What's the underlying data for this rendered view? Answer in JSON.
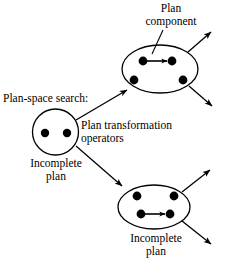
{
  "figure": {
    "background": "#ffffff",
    "stroke": "#000000",
    "width": 227,
    "height": 275
  },
  "labels": {
    "plan_component_line1": "Plan",
    "plan_component_line2": "component",
    "plan_space_search": "Plan-space search:",
    "plan_transformation_line1": "Plan transformation",
    "plan_transformation_line2": "operators",
    "incomplete_plan_left_line1": "Incomplete",
    "incomplete_plan_left_line2": "plan",
    "incomplete_plan_bottom_line1": "Incomplete",
    "incomplete_plan_bottom_line2": "plan"
  },
  "nodes": [
    {
      "id": "left-circle",
      "name": "incomplete-plan-node-left",
      "shape": "circle",
      "cx": 55.5,
      "cy": 132,
      "rx": 23,
      "ry": 23,
      "dots": [
        {
          "cx": 45,
          "cy": 133,
          "r": 4.2,
          "name": "plan-step-dot"
        },
        {
          "cx": 67,
          "cy": 133,
          "r": 4.2,
          "name": "plan-step-dot"
        }
      ],
      "internal_arrows": []
    },
    {
      "id": "top-ellipse",
      "name": "plan-node-top",
      "shape": "ellipse",
      "cx": 160,
      "cy": 69,
      "rx": 38,
      "ry": 24,
      "dots": [
        {
          "cx": 143,
          "cy": 61,
          "r": 4.4,
          "name": "plan-step-dot"
        },
        {
          "cx": 172,
          "cy": 61,
          "r": 4.4,
          "name": "plan-step-dot"
        },
        {
          "cx": 134,
          "cy": 80,
          "r": 4.4,
          "name": "plan-step-dot"
        },
        {
          "cx": 183,
          "cy": 80,
          "r": 4.4,
          "name": "plan-step-dot"
        }
      ],
      "internal_arrows": [
        {
          "x1": 147,
          "y1": 61,
          "x2": 169,
          "y2": 61,
          "name": "plan-component-ordering-arrow"
        }
      ]
    },
    {
      "id": "bottom-ellipse",
      "name": "plan-node-bottom",
      "shape": "ellipse",
      "cx": 154,
      "cy": 207,
      "rx": 36,
      "ry": 22,
      "dots": [
        {
          "cx": 137,
          "cy": 196,
          "r": 4.4,
          "name": "plan-step-dot"
        },
        {
          "cx": 174,
          "cy": 196,
          "r": 4.4,
          "name": "plan-step-dot"
        },
        {
          "cx": 141,
          "cy": 214,
          "r": 4.4,
          "name": "plan-step-dot"
        },
        {
          "cx": 170,
          "cy": 214,
          "r": 4.4,
          "name": "plan-step-dot"
        }
      ],
      "internal_arrows": [
        {
          "x1": 145,
          "y1": 214,
          "x2": 167,
          "y2": 214,
          "name": "plan-component-ordering-arrow"
        }
      ]
    }
  ],
  "edges": [
    {
      "name": "transformation-edge-to-top",
      "x1": 76,
      "y1": 120,
      "x2": 128,
      "y2": 90
    },
    {
      "name": "transformation-edge-to-bottom",
      "x1": 76,
      "y1": 146,
      "x2": 123,
      "y2": 186
    },
    {
      "name": "successor-edge-top-upper",
      "x1": 188,
      "y1": 52,
      "x2": 212,
      "y2": 31
    },
    {
      "name": "successor-edge-top-lower",
      "x1": 189,
      "y1": 86,
      "x2": 213,
      "y2": 107
    },
    {
      "name": "successor-edge-bottom-upper",
      "x1": 182,
      "y1": 192,
      "x2": 211,
      "y2": 169
    },
    {
      "name": "successor-edge-bottom-lower",
      "x1": 182,
      "y1": 221,
      "x2": 212,
      "y2": 245
    }
  ],
  "leader_lines": [
    {
      "name": "plan-component-leader-line",
      "x1": 163,
      "y1": 30,
      "x2": 152,
      "y2": 54
    }
  ]
}
